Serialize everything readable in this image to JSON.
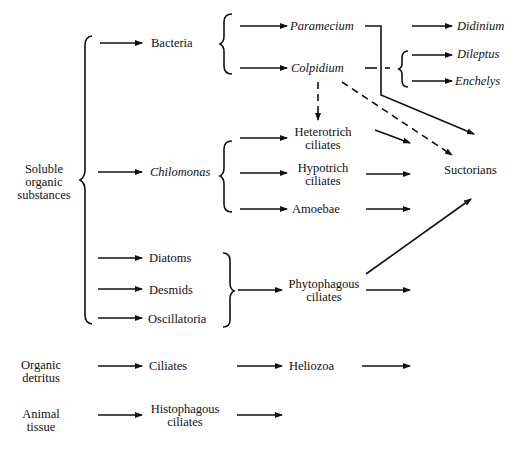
{
  "diagram": {
    "sources": {
      "soluble": "Soluble organic substances",
      "soluble_lines": [
        "Soluble",
        "organic",
        "substances"
      ],
      "detritus_lines": [
        "Organic",
        "detritus"
      ],
      "tissue_lines": [
        "Animal",
        "tissue"
      ]
    },
    "level1": {
      "bacteria": "Bacteria",
      "chilomonas": "Chilomonas",
      "diatoms": "Diatoms",
      "desmids": "Desmids",
      "oscillatoria": "Oscillatoria",
      "ciliates": "Ciliates",
      "histophagous_lines": [
        "Histophagous",
        "ciliates"
      ]
    },
    "level2": {
      "paramecium": "Paramecium",
      "colpidium": "Colpidium",
      "heterotrich_lines": [
        "Heterotrich",
        "ciliates"
      ],
      "hypotrich_lines": [
        "Hypotrich",
        "ciliates"
      ],
      "amoebae": "Amoebae",
      "phytophagous_lines": [
        "Phytophagous",
        "ciliates"
      ],
      "heliozoa": "Heliozoa"
    },
    "level3": {
      "didinium": "Didinium",
      "dileptus": "Dileptus",
      "enchelys": "Enchelys",
      "suctorians": "Suctorians"
    }
  }
}
